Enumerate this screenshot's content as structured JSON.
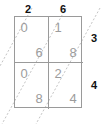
{
  "figure": {
    "type": "lattice-multiplication-grid",
    "rows": 2,
    "columns": 2
  },
  "labels": {
    "top": [
      "2",
      "6"
    ],
    "right": [
      "3",
      "4"
    ]
  },
  "cells": [
    {
      "row": 0,
      "col": 0,
      "tens": "0",
      "units": "6"
    },
    {
      "row": 0,
      "col": 1,
      "tens": "1",
      "units": "8"
    },
    {
      "row": 1,
      "col": 0,
      "tens": "0",
      "units": "8"
    },
    {
      "row": 1,
      "col": 1,
      "tens": "2",
      "units": "4"
    }
  ],
  "colors": {
    "label_text": "#111111",
    "grid_line": "#9a9a9a",
    "cell_digit": "#9c9c9c",
    "diagonal_line": "#c4c4c4",
    "background": "#ffffff"
  }
}
